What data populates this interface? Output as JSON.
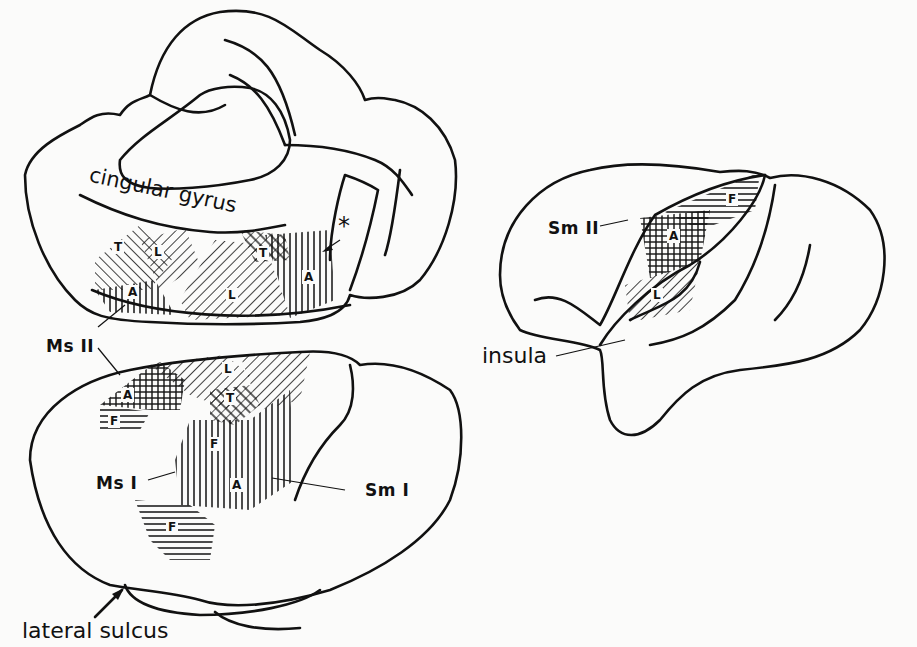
{
  "figure": {
    "panels": [
      {
        "id": "medial-view",
        "labels": {
          "cingular": "cingular gyrus",
          "asterisk": "*"
        },
        "regions": [
          "T",
          "L",
          "A",
          "L",
          "T",
          "A"
        ]
      },
      {
        "id": "lateral-view",
        "labels": {
          "ms2": "Ms II",
          "ms1": "Ms I",
          "sm1": "Sm I",
          "sulcus": "lateral sulcus"
        },
        "regions": [
          "A",
          "F",
          "L",
          "T",
          "F",
          "A",
          "F"
        ]
      },
      {
        "id": "opercular-view",
        "labels": {
          "sm2": "Sm II",
          "insula": "insula"
        },
        "regions": [
          "F",
          "A",
          "L"
        ]
      }
    ],
    "legend_letters": {
      "A": "A",
      "F": "F",
      "L": "L",
      "T": "T"
    }
  }
}
